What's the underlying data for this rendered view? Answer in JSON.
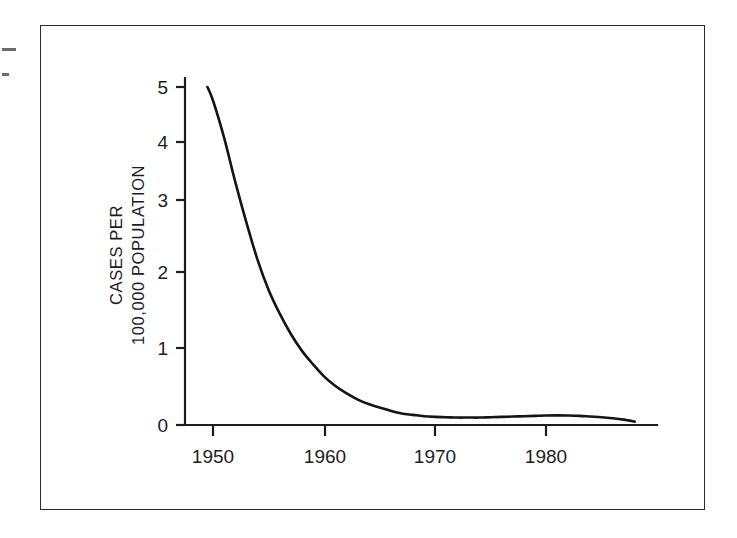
{
  "figure": {
    "background_color": "#ffffff",
    "frame_color": "#2b2b2b",
    "line_color": "#141414"
  },
  "chart_data": {
    "type": "line",
    "title": "",
    "subtitle": "",
    "xlabel": "",
    "ylabel_line1": "CASES PER",
    "ylabel_line2": "100,000 POPULATION",
    "ylabel": "CASES PER 100,000 POPULATION",
    "xlim": [
      1949,
      1989
    ],
    "ylim": [
      0,
      5.4
    ],
    "xticks": [
      1950,
      1960,
      1970,
      1980
    ],
    "xtick_labels": [
      "1950",
      "1960",
      "1970",
      "1980"
    ],
    "yticks": [
      0,
      1,
      2,
      3,
      4,
      5
    ],
    "ytick_labels": [
      "0",
      "1",
      "2",
      "3",
      "4",
      "5"
    ],
    "grid": false,
    "legend": null,
    "series": [
      {
        "name": "Cases per 100,000 population",
        "x": [
          1949.5,
          1950,
          1951,
          1952,
          1953,
          1954,
          1955,
          1956,
          1957,
          1958,
          1959,
          1960,
          1961,
          1962,
          1963,
          1964,
          1965,
          1966,
          1967,
          1968,
          1969,
          1970,
          1971,
          1972,
          1973,
          1974,
          1975,
          1976,
          1977,
          1978,
          1979,
          1980,
          1981,
          1982,
          1983,
          1984,
          1985,
          1986,
          1987,
          1988
        ],
        "y": [
          5.0,
          4.8,
          4.25,
          3.6,
          3.0,
          2.45,
          2.0,
          1.65,
          1.35,
          1.1,
          0.9,
          0.72,
          0.58,
          0.47,
          0.38,
          0.31,
          0.26,
          0.21,
          0.17,
          0.15,
          0.13,
          0.12,
          0.115,
          0.11,
          0.11,
          0.11,
          0.115,
          0.12,
          0.125,
          0.13,
          0.135,
          0.14,
          0.142,
          0.14,
          0.135,
          0.125,
          0.115,
          0.1,
          0.08,
          0.05
        ]
      }
    ],
    "annotations": []
  }
}
